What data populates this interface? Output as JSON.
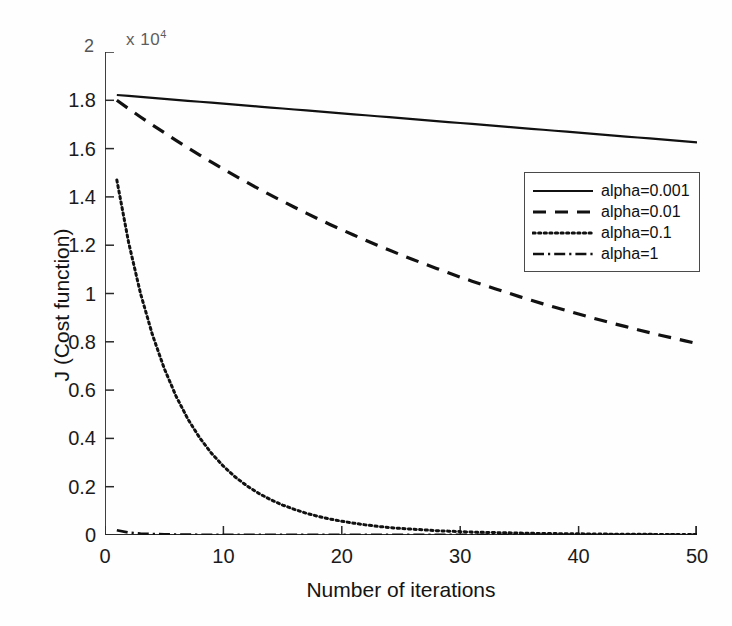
{
  "figure": {
    "y_multiplier_prefix": "x 10",
    "y_multiplier_exponent": "4",
    "y_axis_top_value": "2"
  },
  "axes": {
    "xlabel": "Number of iterations",
    "ylabel": "J (Cost function)",
    "xticks": [
      "0",
      "10",
      "20",
      "30",
      "40",
      "50"
    ],
    "yticks": [
      "0",
      "0.2",
      "0.4",
      "0.6",
      "0.8",
      "1",
      "1.2",
      "1.4",
      "1.6",
      "1.8"
    ]
  },
  "legend": {
    "entries": [
      {
        "label": "alpha=0.001",
        "style": "solid"
      },
      {
        "label": "alpha=0.01",
        "style": "dashed"
      },
      {
        "label": "alpha=0.1",
        "style": "dotted"
      },
      {
        "label": "alpha=1",
        "style": "dashdot"
      }
    ]
  },
  "colors": {
    "line": "#111111",
    "axis": "#2a2a2a",
    "background": "#fefefe"
  },
  "chart_data": {
    "type": "line",
    "title": "",
    "xlabel": "Number of iterations",
    "ylabel": "J (Cost function)",
    "xlim": [
      0,
      50
    ],
    "ylim": [
      0,
      2
    ],
    "y_multiplier": 10000,
    "grid": false,
    "legend_position": "upper right",
    "x": [
      1,
      2,
      3,
      4,
      5,
      6,
      7,
      8,
      9,
      10,
      11,
      12,
      13,
      14,
      15,
      16,
      17,
      18,
      19,
      20,
      21,
      22,
      23,
      24,
      25,
      26,
      27,
      28,
      29,
      30,
      31,
      32,
      33,
      34,
      35,
      36,
      37,
      38,
      39,
      40,
      41,
      42,
      43,
      44,
      45,
      46,
      47,
      48,
      49,
      50
    ],
    "series": [
      {
        "name": "alpha=0.001",
        "style": "solid",
        "values": [
          1.822,
          1.818,
          1.814,
          1.81,
          1.806,
          1.802,
          1.798,
          1.794,
          1.79,
          1.786,
          1.782,
          1.778,
          1.774,
          1.77,
          1.766,
          1.762,
          1.758,
          1.754,
          1.75,
          1.746,
          1.742,
          1.738,
          1.734,
          1.73,
          1.726,
          1.722,
          1.718,
          1.714,
          1.71,
          1.706,
          1.702,
          1.698,
          1.694,
          1.69,
          1.686,
          1.682,
          1.678,
          1.674,
          1.67,
          1.666,
          1.662,
          1.658,
          1.654,
          1.65,
          1.646,
          1.642,
          1.638,
          1.634,
          1.63,
          1.626
        ]
      },
      {
        "name": "alpha=0.01",
        "style": "dashed",
        "values": [
          1.8,
          1.765,
          1.731,
          1.698,
          1.666,
          1.634,
          1.603,
          1.573,
          1.544,
          1.515,
          1.487,
          1.46,
          1.433,
          1.407,
          1.382,
          1.357,
          1.333,
          1.309,
          1.286,
          1.264,
          1.242,
          1.221,
          1.2,
          1.18,
          1.16,
          1.141,
          1.122,
          1.104,
          1.086,
          1.068,
          1.051,
          1.035,
          1.019,
          1.003,
          0.987,
          0.972,
          0.957,
          0.943,
          0.929,
          0.915,
          0.901,
          0.888,
          0.875,
          0.863,
          0.85,
          0.838,
          0.826,
          0.815,
          0.804,
          0.793
        ]
      },
      {
        "name": "alpha=0.1",
        "style": "dotted",
        "values": [
          1.47,
          1.21,
          1.0,
          0.83,
          0.69,
          0.575,
          0.48,
          0.402,
          0.338,
          0.285,
          0.24,
          0.203,
          0.172,
          0.146,
          0.124,
          0.106,
          0.09,
          0.077,
          0.066,
          0.057,
          0.049,
          0.042,
          0.036,
          0.031,
          0.027,
          0.024,
          0.021,
          0.018,
          0.016,
          0.014,
          0.012,
          0.011,
          0.01,
          0.009,
          0.008,
          0.007,
          0.006,
          0.006,
          0.005,
          0.005,
          0.004,
          0.004,
          0.003,
          0.003,
          0.003,
          0.003,
          0.002,
          0.002,
          0.002,
          0.002
        ]
      },
      {
        "name": "alpha=1",
        "style": "dashdot",
        "values": [
          0.02,
          0.01,
          0.006,
          0.004,
          0.003,
          0.002,
          0.002,
          0.001,
          0.001,
          0.001,
          0.001,
          0.001,
          0.001,
          0.001,
          0.001,
          0.001,
          0.001,
          0.001,
          0.001,
          0.001,
          0.001,
          0.001,
          0.001,
          0.001,
          0.001,
          0.001,
          0.001,
          0.001,
          0.001,
          0.001,
          0.001,
          0.001,
          0.001,
          0.001,
          0.001,
          0.001,
          0.001,
          0.001,
          0.001,
          0.001,
          0.001,
          0.001,
          0.001,
          0.001,
          0.001,
          0.001,
          0.001,
          0.001,
          0.001,
          0.001
        ]
      }
    ]
  }
}
